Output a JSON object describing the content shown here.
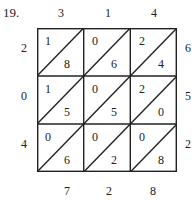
{
  "problem": {
    "label": "19.",
    "top_digits": [
      "3",
      "1",
      "4"
    ],
    "left_digits": [
      "2",
      "0",
      "4"
    ],
    "right_digits": [
      "6",
      "5",
      "2"
    ],
    "bottom_digits": [
      "7",
      "2",
      "8"
    ],
    "cells": [
      [
        {
          "tens": "1",
          "ones": "8"
        },
        {
          "tens": "0",
          "ones": "6"
        },
        {
          "tens": "2",
          "ones": "4"
        }
      ],
      [
        {
          "tens": "1",
          "ones": "5"
        },
        {
          "tens": "0",
          "ones": "5"
        },
        {
          "tens": "2",
          "ones": "0"
        }
      ],
      [
        {
          "tens": "0",
          "ones": "6"
        },
        {
          "tens": "0",
          "ones": "2"
        },
        {
          "tens": "0",
          "ones": "8"
        }
      ]
    ]
  }
}
